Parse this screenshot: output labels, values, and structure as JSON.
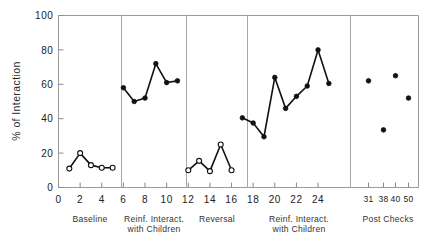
{
  "chart_data": {
    "type": "line",
    "title": "",
    "xlabel": "",
    "ylabel": "% of Interaction",
    "ylim": [
      0,
      100
    ],
    "xlim": [
      0,
      27
    ],
    "grid": false,
    "legend": "none",
    "y_ticks": [
      "0",
      "20",
      "40",
      "60",
      "80",
      "100"
    ],
    "y_tick_values": [
      0,
      20,
      40,
      60,
      80,
      100
    ],
    "x_ticks_main": [
      "0",
      "2",
      "4",
      "6",
      "8",
      "10",
      "12",
      "14",
      "16",
      "18",
      "20",
      "22",
      "24"
    ],
    "x_tick_values_main": [
      0,
      2,
      4,
      6,
      8,
      10,
      12,
      14,
      16,
      18,
      20,
      22,
      24
    ],
    "x_ticks_post": [
      "31",
      "38",
      "40",
      "50"
    ],
    "x_tick_values_post": [
      31,
      38,
      40,
      50
    ],
    "phases": [
      {
        "label_line1": "Baseline",
        "label_line2": "",
        "marker": "open",
        "connected": true
      },
      {
        "label_line1": "Reinf. Interact.",
        "label_line2": "with Children",
        "marker": "filled",
        "connected": true
      },
      {
        "label_line1": "Reversal",
        "label_line2": "",
        "marker": "open",
        "connected": true
      },
      {
        "label_line1": "Reinf. Interact.",
        "label_line2": "with Children",
        "marker": "filled",
        "connected": true
      },
      {
        "label_line1": "Post Checks",
        "label_line2": "",
        "marker": "filled",
        "connected": false
      }
    ],
    "series": [
      {
        "name": "Baseline",
        "marker": "open",
        "connected": true,
        "x": [
          1,
          2,
          3,
          4,
          5
        ],
        "values": [
          11,
          20,
          13,
          11.5,
          11.5
        ]
      },
      {
        "name": "Reinf. Interact. with Children (1)",
        "marker": "filled",
        "connected": true,
        "x": [
          6,
          7,
          8,
          9,
          10,
          11
        ],
        "values": [
          58,
          50,
          52,
          72,
          61,
          62
        ]
      },
      {
        "name": "Reversal",
        "marker": "open",
        "connected": true,
        "x": [
          12,
          13,
          14,
          15,
          16
        ],
        "values": [
          10,
          15.5,
          9.5,
          25,
          10
        ]
      },
      {
        "name": "Reinf. Interact. with Children (2)",
        "marker": "filled",
        "connected": true,
        "x": [
          17,
          18,
          19,
          20,
          21,
          22,
          23,
          24,
          25
        ],
        "values": [
          40.5,
          37.5,
          29.5,
          64,
          46,
          53,
          59,
          80,
          60.5
        ]
      },
      {
        "name": "Post Checks",
        "marker": "filled",
        "connected": false,
        "x": [
          31,
          38,
          40,
          50
        ],
        "values": [
          62,
          33.5,
          65,
          52
        ]
      }
    ]
  },
  "axes": {
    "y_label": "% of Interaction"
  }
}
